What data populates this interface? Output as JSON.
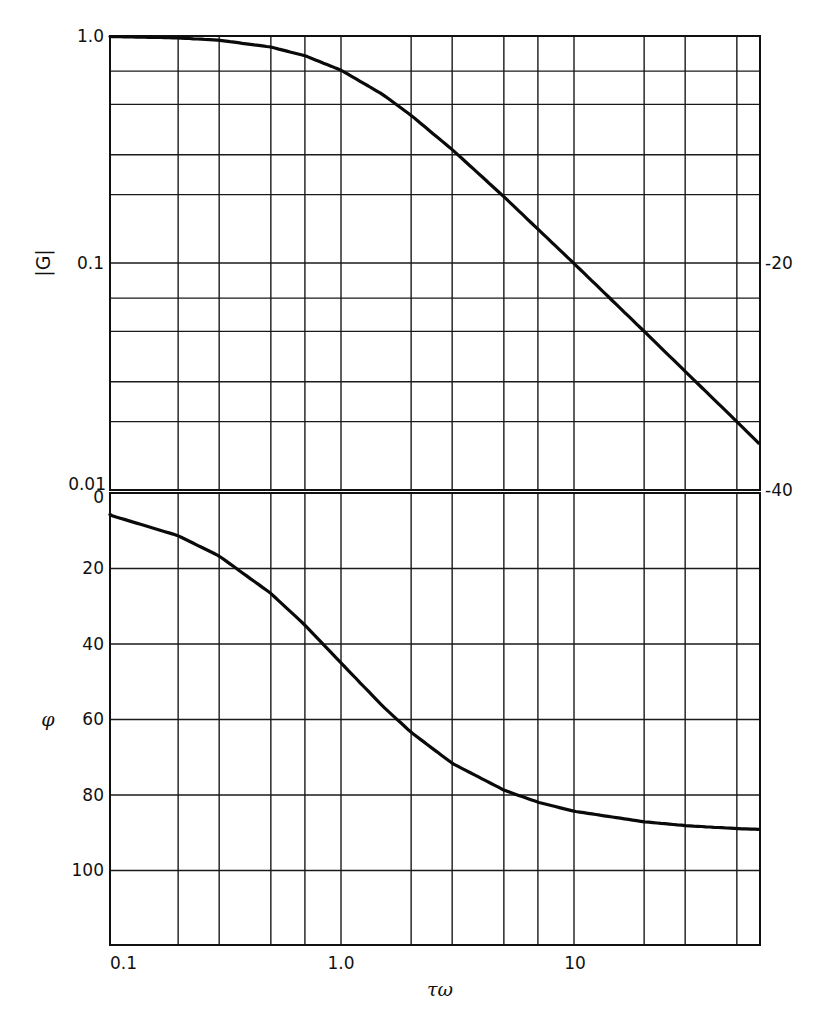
{
  "chart_data": [
    {
      "type": "line",
      "title": "",
      "panel": "magnitude",
      "xlabel": "τω",
      "ylabel": "|G|",
      "x_scale": "log",
      "y_scale": "log",
      "xlim": [
        0.1,
        62
      ],
      "ylim": [
        0.01,
        1.0
      ],
      "x_ticks": [
        0.1,
        1.0,
        10
      ],
      "x_tick_labels": [
        "0.1",
        "1.0",
        "10"
      ],
      "x_gridlines": [
        0.1,
        0.2,
        0.3,
        0.5,
        0.7,
        1,
        2,
        3,
        5,
        7,
        10,
        20,
        30,
        50
      ],
      "y_ticks": [
        1.0,
        0.1,
        0.01
      ],
      "y_tick_labels": [
        "1.0",
        "0.1",
        "0.01"
      ],
      "y_gridlines": [
        1.0,
        0.7,
        0.5,
        0.3,
        0.2,
        0.1,
        0.07,
        0.05,
        0.03,
        0.02,
        0.01
      ],
      "right_axis_labels": [
        {
          "at": 0.1,
          "label": "-20"
        },
        {
          "at": 0.01,
          "label": "-40"
        }
      ],
      "grid": true,
      "series": [
        {
          "name": "|G|",
          "x": [
            0.1,
            0.2,
            0.3,
            0.5,
            0.7,
            1.0,
            1.5,
            2,
            3,
            5,
            7,
            10,
            20,
            30,
            50,
            62
          ],
          "y": [
            0.995,
            0.981,
            0.958,
            0.894,
            0.819,
            0.707,
            0.555,
            0.447,
            0.316,
            0.196,
            0.141,
            0.0995,
            0.05,
            0.0333,
            0.02,
            0.0161
          ]
        }
      ]
    },
    {
      "type": "line",
      "title": "",
      "panel": "phase",
      "xlabel": "τω",
      "ylabel": "φ",
      "x_scale": "log",
      "y_scale": "linear",
      "xlim": [
        0.1,
        62
      ],
      "ylim": [
        0,
        120
      ],
      "y_inverted": true,
      "x_ticks": [
        0.1,
        1.0,
        10
      ],
      "x_tick_labels": [
        "0.1",
        "1.0",
        "10"
      ],
      "x_gridlines": [
        0.1,
        0.2,
        0.3,
        0.5,
        0.7,
        1,
        2,
        3,
        5,
        7,
        10,
        20,
        30,
        50
      ],
      "y_ticks": [
        0,
        20,
        40,
        60,
        80,
        100
      ],
      "y_tick_labels": [
        "0",
        "20",
        "40",
        "60",
        "80",
        "100"
      ],
      "y_gridlines": [
        0,
        20,
        40,
        60,
        80,
        100
      ],
      "grid": true,
      "series": [
        {
          "name": "φ",
          "x": [
            0.1,
            0.2,
            0.3,
            0.5,
            0.7,
            1.0,
            1.5,
            2,
            3,
            5,
            7,
            10,
            20,
            30,
            50,
            62
          ],
          "y": [
            5.7,
            11.3,
            16.7,
            26.6,
            35.0,
            45.0,
            56.3,
            63.4,
            71.6,
            78.7,
            81.9,
            84.3,
            87.1,
            88.1,
            88.9,
            89.1
          ]
        }
      ]
    }
  ],
  "labels": {
    "mag_ylabel": "|G|",
    "phase_ylabel": "φ",
    "xlabel": "τω",
    "mag_y_ticks": [
      "1.0",
      "0.1",
      "0.01"
    ],
    "mag_right_ticks": [
      "-20",
      "-40"
    ],
    "phase_y_ticks": [
      "0",
      "20",
      "40",
      "60",
      "80",
      "100"
    ],
    "x_ticks": [
      "0.1",
      "1.0",
      "10"
    ]
  }
}
